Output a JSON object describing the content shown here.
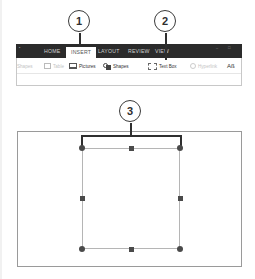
{
  "ribbon": {
    "tabs": [
      {
        "label": "HOME",
        "active": false
      },
      {
        "label": "INSERT",
        "active": true
      },
      {
        "label": "LAYOUT",
        "active": false
      },
      {
        "label": "REVIEW",
        "active": false
      },
      {
        "label": "VIEW",
        "active": false
      }
    ],
    "tools": [
      {
        "label": "Shapes",
        "icon": "shapes-icon",
        "enabled": false,
        "leading": true
      },
      {
        "label": "Table",
        "icon": "table-icon",
        "enabled": false
      },
      {
        "label": "Pictures",
        "icon": "pictures-icon",
        "enabled": true
      },
      {
        "label": "Shapes",
        "icon": "shapes-icon",
        "enabled": true
      },
      {
        "label": "Text Box",
        "icon": "textbox-icon",
        "enabled": true
      },
      {
        "label": "Hyperlink",
        "icon": "hyperlink-icon",
        "enabled": false
      },
      {
        "label": "Aß",
        "icon": "wordart-icon",
        "enabled": true
      }
    ]
  },
  "callouts": [
    {
      "number": "1",
      "target": "INSERT tab"
    },
    {
      "number": "2",
      "target": "Text Box button"
    },
    {
      "number": "3",
      "target": "Text box width"
    }
  ],
  "colors": {
    "tabbar": "#2b2b2b",
    "callout_stroke": "#3a3a3a",
    "handle": "#4a4a4a",
    "selection_border": "#b5b5b5"
  }
}
